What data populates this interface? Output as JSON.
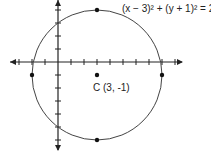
{
  "chart_data": {
    "type": "scatter",
    "title": "",
    "equation": "(x − 3)² + (y + 1)² = 25",
    "center": {
      "x": 3,
      "y": -1,
      "label": "C (3, -1)"
    },
    "radius": 5,
    "points": [
      {
        "x": 3,
        "y": 4
      },
      {
        "x": 3,
        "y": -6
      },
      {
        "x": -2,
        "y": -1
      },
      {
        "x": 8,
        "y": -1
      },
      {
        "x": 3,
        "y": -1
      }
    ],
    "xlim": [
      -3.5,
      9.5
    ],
    "ylim": [
      -6.5,
      4.5
    ],
    "xlabel": "",
    "ylabel": "",
    "grid": false
  }
}
